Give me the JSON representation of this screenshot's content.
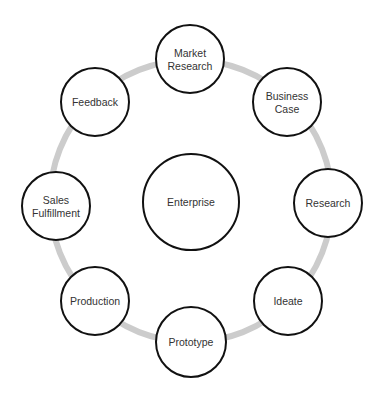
{
  "diagram": {
    "type": "cycle",
    "colors": {
      "ring": "#cccccc",
      "node_border": "#111111",
      "node_fill": "#ffffff",
      "text": "#333333"
    },
    "center": {
      "label": "Enterprise",
      "cx": 191,
      "cy": 202,
      "r": 48
    },
    "ring": {
      "cx": 191,
      "cy": 201,
      "r": 141,
      "stroke_width": 6
    },
    "nodes": [
      {
        "id": "market-research",
        "lines": [
          "Market",
          "Research"
        ],
        "cx": 190,
        "cy": 59,
        "r": 34
      },
      {
        "id": "business-case",
        "lines": [
          "Business",
          "Case"
        ],
        "cx": 287,
        "cy": 102,
        "r": 34
      },
      {
        "id": "research",
        "lines": [
          "Research"
        ],
        "cx": 328,
        "cy": 203,
        "r": 34
      },
      {
        "id": "ideate",
        "lines": [
          "Ideate"
        ],
        "cx": 288,
        "cy": 301,
        "r": 34
      },
      {
        "id": "prototype",
        "lines": [
          "Prototype"
        ],
        "cx": 191,
        "cy": 342,
        "r": 35
      },
      {
        "id": "production",
        "lines": [
          "Production"
        ],
        "cx": 95,
        "cy": 301,
        "r": 34
      },
      {
        "id": "sales-fulfillment",
        "lines": [
          "Sales",
          "Fulfillment"
        ],
        "cx": 56,
        "cy": 206,
        "r": 34
      },
      {
        "id": "feedback",
        "lines": [
          "Feedback"
        ],
        "cx": 95,
        "cy": 102,
        "r": 34
      }
    ]
  }
}
